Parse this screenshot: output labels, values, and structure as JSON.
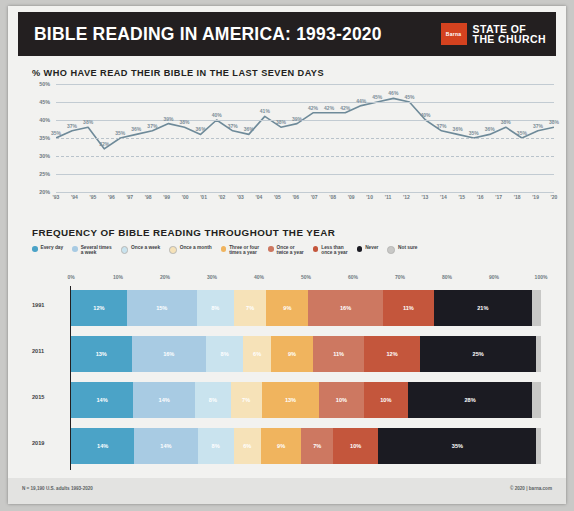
{
  "header": {
    "title": "BIBLE READING IN AMERICA: 1993-2020",
    "logo_text": "Barna",
    "brand_line1": "STATE OF",
    "brand_line2": "THE CHURCH",
    "logo_color": "#d4421f"
  },
  "footer": {
    "left": "N = 19,190 U.S. adults  1993-2020",
    "right": "© 2020 | barna.com"
  },
  "chart_data": [
    {
      "type": "line",
      "title": "% WHO HAVE READ THEIR BIBLE IN THE LAST SEVEN DAYS",
      "xlabel": "",
      "ylabel": "",
      "ylim": [
        20,
        50
      ],
      "yticks": [
        "50%",
        "45%",
        "40%",
        "35%",
        "30%",
        "25%",
        "20%"
      ],
      "grid": true,
      "line_color": "#6e8a99",
      "categories": [
        "'93",
        "'94",
        "'95",
        "'96",
        "'97",
        "'98",
        "'99",
        "'00",
        "'01",
        "'02",
        "'03",
        "'04",
        "'05",
        "'06",
        "'07",
        "'08",
        "'09",
        "'10",
        "'11",
        "'12",
        "'13",
        "'14",
        "'15",
        "'16",
        "'17",
        "'18",
        "'19",
        "'20"
      ],
      "values": [
        35,
        37,
        38,
        32,
        35,
        36,
        37,
        39,
        38,
        36,
        40,
        37,
        36,
        41,
        38,
        39,
        42,
        42,
        42,
        44,
        45,
        46,
        45,
        40,
        37,
        36,
        35,
        36,
        38,
        35,
        37,
        38
      ],
      "point_labels": [
        "35%",
        "37%",
        "38%",
        "32%",
        "35%",
        "36%",
        "37%",
        "39%",
        "38%",
        "36%",
        "40%",
        "37%",
        "36%",
        "41%",
        "38%",
        "39%",
        "42%",
        "42%",
        "42%",
        "44%",
        "45%",
        "46%",
        "45%",
        "40%",
        "37%",
        "36%",
        "35%",
        "36%",
        "38%",
        "35%",
        "37%",
        "38%"
      ]
    },
    {
      "type": "bar",
      "subtype": "stacked-horizontal-100",
      "title": "FREQUENCY OF BIBLE READING THROUGHOUT THE YEAR",
      "xticks": [
        "0%",
        "10%",
        "20%",
        "30%",
        "40%",
        "50%",
        "60%",
        "70%",
        "80%",
        "90%",
        "100%"
      ],
      "xlim": [
        0,
        100
      ],
      "legend_position": "top",
      "legend": [
        {
          "label": "Every day",
          "color": "#4ba3c7"
        },
        {
          "label": "Several times\na week",
          "color": "#a8cbe3"
        },
        {
          "label": "Once a week",
          "color": "#c9e3ee"
        },
        {
          "label": "Once a month",
          "color": "#f6e2b8"
        },
        {
          "label": "Three or four\ntimes a year",
          "color": "#f0b45e"
        },
        {
          "label": "Once or\ntwice a year",
          "color": "#cd7861"
        },
        {
          "label": "Less than\nonce a year",
          "color": "#c4563c"
        },
        {
          "label": "Never",
          "color": "#1b1b22"
        },
        {
          "label": "Not sure",
          "color": "#c8c8c6"
        }
      ],
      "categories": [
        "1991",
        "2011",
        "2015",
        "2019"
      ],
      "series": [
        {
          "name": "Every day",
          "color": "#4ba3c7",
          "values": [
            12,
            13,
            14,
            14
          ]
        },
        {
          "name": "Several times a week",
          "color": "#a8cbe3",
          "values": [
            15,
            16,
            14,
            14
          ]
        },
        {
          "name": "Once a week",
          "color": "#c9e3ee",
          "values": [
            8,
            8,
            8,
            8
          ]
        },
        {
          "name": "Once a month",
          "color": "#f6e2b8",
          "values": [
            7,
            6,
            7,
            6
          ]
        },
        {
          "name": "Three or four times a year",
          "color": "#f0b45e",
          "values": [
            9,
            9,
            13,
            9
          ]
        },
        {
          "name": "Once or twice a year",
          "color": "#cd7861",
          "values": [
            16,
            11,
            10,
            7
          ]
        },
        {
          "name": "Less than once a year",
          "color": "#c4563c",
          "values": [
            11,
            12,
            10,
            10
          ]
        },
        {
          "name": "Never",
          "color": "#1b1b22",
          "values": [
            21,
            25,
            28,
            35
          ]
        },
        {
          "name": "Not sure",
          "color": "#c8c8c6",
          "values": [
            2,
            1,
            2,
            1
          ]
        }
      ],
      "bar_labels": [
        [
          "12%",
          "15%",
          "8%",
          "7%",
          "9%",
          "16%",
          "11%",
          "21%",
          "2%"
        ],
        [
          "13%",
          "16%",
          "8%",
          "6%",
          "9%",
          "11%",
          "12%",
          "25%",
          "1%"
        ],
        [
          "14%",
          "14%",
          "8%",
          "7%",
          "13%",
          "10%",
          "10%",
          "28%",
          "2%"
        ],
        [
          "14%",
          "14%",
          "8%",
          "6%",
          "9%",
          "7%",
          "10%",
          "35%",
          "1%"
        ]
      ]
    }
  ]
}
